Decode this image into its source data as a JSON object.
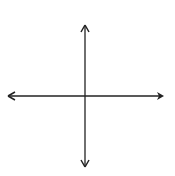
{
  "header": {
    "mark": "y ="
  },
  "grid": {
    "xmin": -6,
    "xmax": 6,
    "ymin": -6,
    "ymax": 6,
    "origin_px": [
      85,
      96
    ],
    "unit_px": 12,
    "grid_color": "#d0d0d0",
    "axis_color": "#222222"
  },
  "axes": {
    "x_label": "x",
    "y_label": "y",
    "x_ticks": [
      {
        "value": -4,
        "label": "−4"
      },
      {
        "value": -2,
        "label": "−2"
      },
      {
        "value": 0,
        "label": "0"
      },
      {
        "value": 2,
        "label": "2"
      },
      {
        "value": 4,
        "label": "4"
      }
    ],
    "y_ticks": [
      {
        "value": 4,
        "label": "4"
      },
      {
        "value": 2,
        "label": "2"
      },
      {
        "value": -2,
        "label": "−2"
      },
      {
        "value": -4,
        "label": "−4"
      }
    ]
  }
}
